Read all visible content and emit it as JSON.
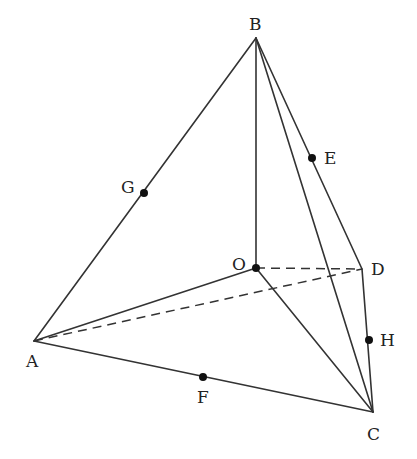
{
  "diagram": {
    "type": "tetrahedron",
    "vertices": {
      "A": {
        "x": 34,
        "y": 341,
        "label": "A",
        "lx": 26,
        "ly": 367
      },
      "B": {
        "x": 256,
        "y": 38,
        "label": "B",
        "lx": 249,
        "ly": 30
      },
      "C": {
        "x": 373,
        "y": 412,
        "label": "C",
        "lx": 367,
        "ly": 440
      },
      "D": {
        "x": 362,
        "y": 269,
        "label": "D",
        "lx": 371,
        "ly": 275
      },
      "O": {
        "x": 256,
        "y": 268,
        "label": "O",
        "lx": 232,
        "ly": 270
      }
    },
    "points": {
      "G": {
        "x": 144,
        "y": 193,
        "label": "G",
        "lx": 121,
        "ly": 193
      },
      "E": {
        "x": 312,
        "y": 158,
        "label": "E",
        "lx": 324,
        "ly": 164
      },
      "F": {
        "x": 203,
        "y": 377,
        "label": "F",
        "lx": 197,
        "ly": 403
      },
      "H": {
        "x": 369,
        "y": 340,
        "label": "H",
        "lx": 380,
        "ly": 346
      }
    },
    "solid_edges": [
      [
        "B",
        "A"
      ],
      [
        "B",
        "O"
      ],
      [
        "B",
        "C"
      ],
      [
        "B",
        "D"
      ],
      [
        "A",
        "O"
      ],
      [
        "O",
        "C"
      ],
      [
        "A",
        "C"
      ],
      [
        "D",
        "C"
      ]
    ],
    "dashed_edges": [
      [
        "O",
        "D"
      ],
      [
        "A",
        "D"
      ]
    ],
    "colors": {
      "line": "#333333",
      "point": "#111111",
      "text": "#222222"
    }
  }
}
